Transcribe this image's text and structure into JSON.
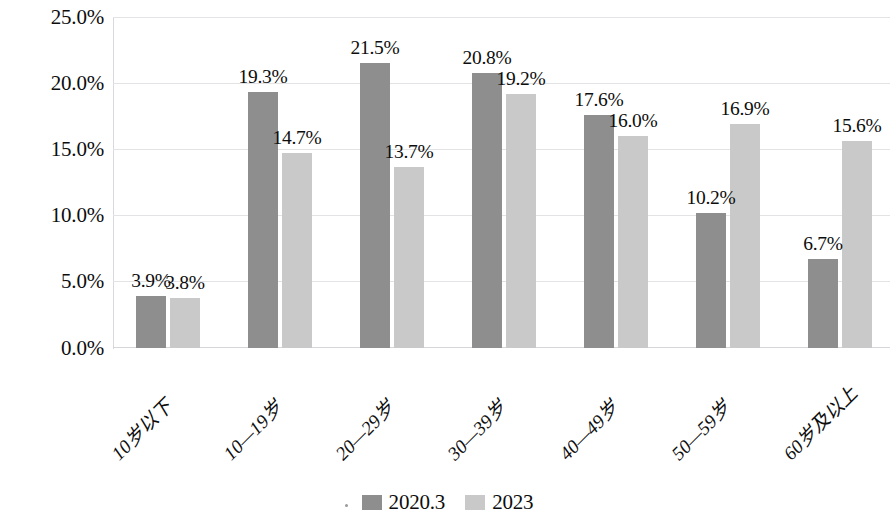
{
  "chart_data": {
    "type": "bar",
    "title": "",
    "subtitle": "",
    "xlabel": "",
    "ylabel": "",
    "categories": [
      "10岁以下",
      "10—19岁",
      "20—29岁",
      "30—39岁",
      "40—49岁",
      "50—59岁",
      "60岁及以上"
    ],
    "series": [
      {
        "name": "2020.3",
        "color": "#8e8e8e",
        "values": [
          3.9,
          19.3,
          21.5,
          20.8,
          17.6,
          10.2,
          6.7
        ],
        "labels": [
          "3.9%",
          "19.3%",
          "21.5%",
          "20.8%",
          "17.6%",
          "10.2%",
          "6.7%"
        ]
      },
      {
        "name": "2023",
        "color": "#c9c9c9",
        "values": [
          3.8,
          14.7,
          13.7,
          19.2,
          16.0,
          16.9,
          15.6
        ],
        "labels": [
          "3.8%",
          "14.7%",
          "13.7%",
          "19.2%",
          "16.0%",
          "16.9%",
          "15.6%"
        ]
      }
    ],
    "ylim": [
      0,
      25
    ],
    "ytick_values": [
      0,
      5,
      10,
      15,
      20,
      25
    ],
    "ytick_labels": [
      "0.0%",
      "5.0%",
      "10.0%",
      "15.0%",
      "20.0%",
      "25.0%"
    ],
    "grid": true,
    "legend_position": "bottom",
    "value_unit": "%"
  },
  "legend": {
    "items": [
      {
        "label": "2020.3"
      },
      {
        "label": "2023"
      }
    ]
  }
}
